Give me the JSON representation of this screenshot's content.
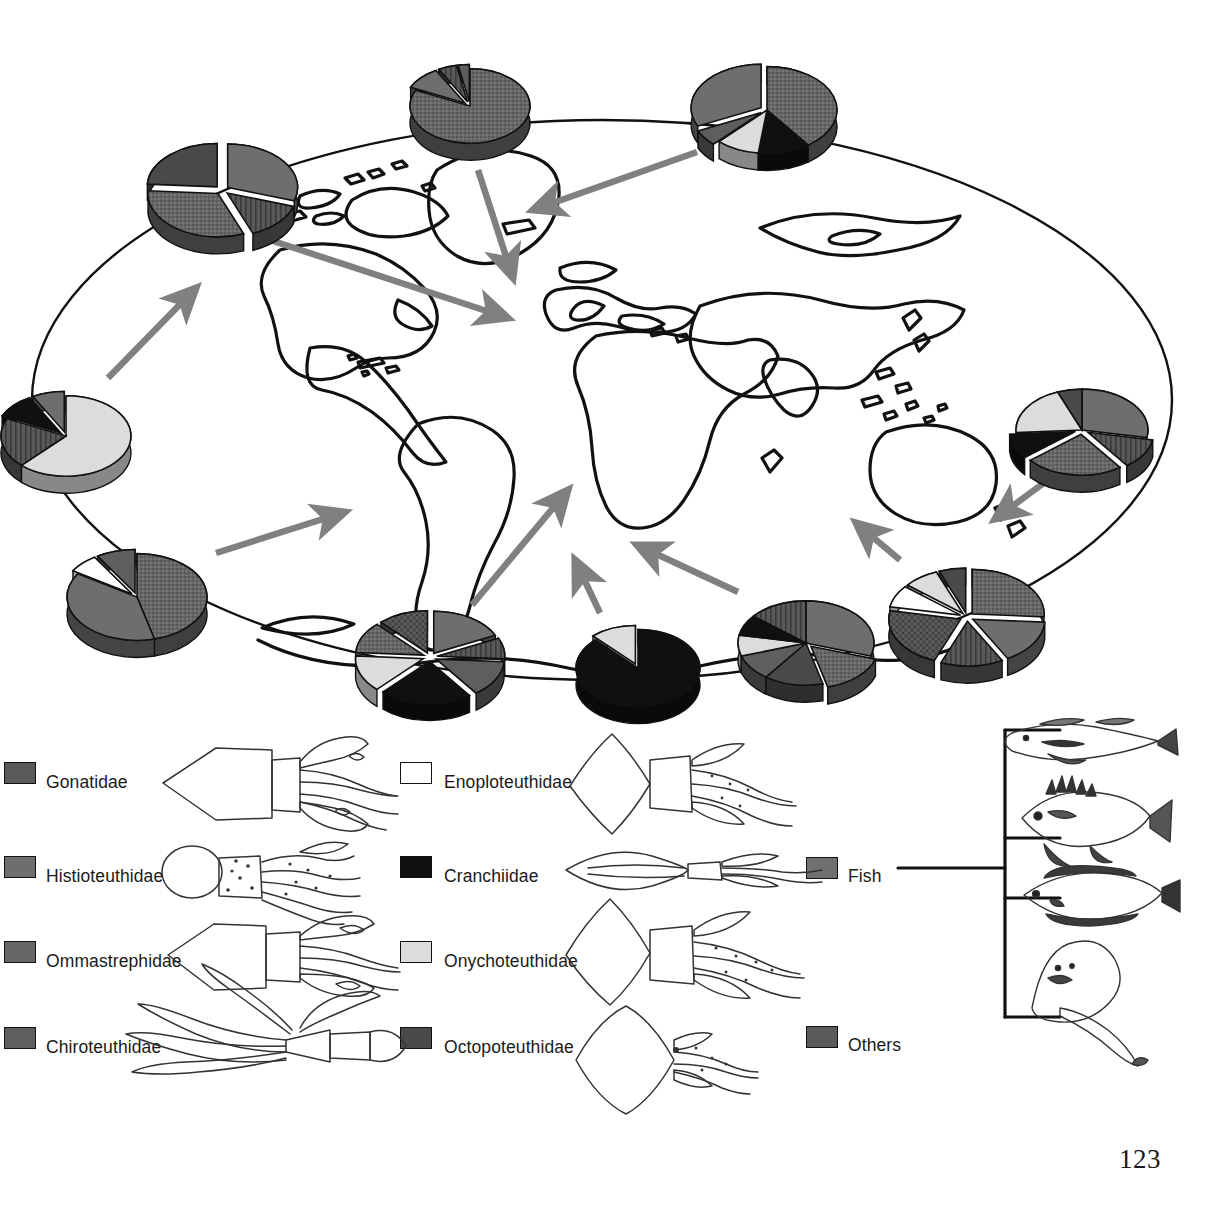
{
  "figure": {
    "page_number": "123",
    "map": {
      "shape": "ellipse",
      "projection_outline_color": "#000000",
      "arrow_color": "#808080"
    }
  },
  "palette": {
    "gonatidae": "#595959",
    "histioteuthidae": "#6e6e6e",
    "ommastrephidae": "#666666",
    "chiroteuthidae": "#5e5e5e",
    "enoploteuthidae": "#ffffff",
    "cranchiidae": "#101010",
    "onychoteuthidae": "#dcdcdc",
    "octopoteuthidae": "#4a4a4a",
    "fish": "#707070",
    "others": "#5a5a5a",
    "outline": "#111111",
    "arrow": "#808080"
  },
  "legend": {
    "columns": [
      {
        "name": "squid-column-1",
        "items": [
          {
            "label": "Gonatidae",
            "color_key": "gonatidae",
            "pattern": "vertical-lines",
            "illustration": "gonatid-squid-drawing"
          },
          {
            "label": "Histioteuthidae",
            "color_key": "histioteuthidae",
            "pattern": "solid",
            "illustration": "histioteuthid-squid-drawing"
          },
          {
            "label": "Ommastrephidae",
            "color_key": "ommastrephidae",
            "pattern": "speckle",
            "illustration": "ommastrephid-squid-drawing"
          },
          {
            "label": "Chiroteuthidae",
            "color_key": "chiroteuthidae",
            "pattern": "solid",
            "illustration": "chiroteuthid-squid-drawing"
          }
        ]
      },
      {
        "name": "squid-column-2",
        "items": [
          {
            "label": "Enoploteuthidae",
            "color_key": "enoploteuthidae",
            "pattern": "solid",
            "illustration": "enoploteuthid-squid-drawing"
          },
          {
            "label": "Cranchiidae",
            "color_key": "cranchiidae",
            "pattern": "solid",
            "illustration": "cranchiid-squid-drawing"
          },
          {
            "label": "Onychoteuthidae",
            "color_key": "onychoteuthidae",
            "pattern": "solid",
            "illustration": "onychoteuthid-squid-drawing"
          },
          {
            "label": "Octopoteuthidae",
            "color_key": "octopoteuthidae",
            "pattern": "solid",
            "illustration": "octopoteuthid-squid-drawing"
          }
        ]
      },
      {
        "name": "prey-column-3",
        "items": [
          {
            "label": "Fish",
            "color_key": "fish",
            "pattern": "solid",
            "illustration": "fish-bracket-drawings"
          },
          {
            "label": "Others",
            "color_key": "others",
            "pattern": "cross-hatch",
            "illustration": "none"
          }
        ]
      }
    ],
    "fish_bracket": {
      "name": "fish-bracket",
      "illustrations": [
        "hake-fish-drawing",
        "redfish-drawing",
        "flatfish-drawing",
        "ray-drawing"
      ]
    }
  },
  "chart_data": {
    "type": "pie",
    "title": "",
    "subtitle": "",
    "categories": [
      "Gonatidae",
      "Histioteuthidae",
      "Ommastrephidae",
      "Chiroteuthidae",
      "Enoploteuthidae",
      "Cranchiidae",
      "Onychoteuthidae",
      "Octopoteuthidae",
      "Fish",
      "Others"
    ],
    "legend_position": "bottom",
    "grid": false,
    "charts": [
      {
        "id": "pie-north-pacific-west",
        "label": "",
        "cx": 222,
        "cy": 190,
        "r": 70,
        "slices": [
          {
            "category": "Histioteuthidae",
            "value": 30,
            "exploded": true
          },
          {
            "category": "Gonatidae",
            "value": 14,
            "exploded": true
          },
          {
            "category": "Ommastrephidae",
            "value": 32,
            "exploded": true
          },
          {
            "category": "Octopoteuthidae",
            "value": 24,
            "exploded": true
          }
        ]
      },
      {
        "id": "pie-arctic-north",
        "label": "",
        "cx": 470,
        "cy": 106,
        "r": 60,
        "slices": [
          {
            "category": "Ommastrephidae",
            "value": 82,
            "exploded": false
          },
          {
            "category": "Histioteuthidae",
            "value": 10,
            "exploded": true
          },
          {
            "category": "Gonatidae",
            "value": 5,
            "exploded": true
          },
          {
            "category": "Chiroteuthidae",
            "value": 3,
            "exploded": true
          }
        ]
      },
      {
        "id": "pie-north-atlantic-east",
        "label": "",
        "cx": 767,
        "cy": 110,
        "r": 70,
        "slices": [
          {
            "category": "Ommastrephidae",
            "value": 40,
            "exploded": false
          },
          {
            "category": "Cranchiidae",
            "value": 12,
            "exploded": false
          },
          {
            "category": "Onychoteuthidae",
            "value": 10,
            "exploded": false
          },
          {
            "category": "Chiroteuthidae",
            "value": 6,
            "exploded": true
          },
          {
            "category": "Histioteuthidae",
            "value": 32,
            "exploded": true
          }
        ]
      },
      {
        "id": "pie-west-atlantic",
        "label": "",
        "cx": 66,
        "cy": 436,
        "r": 65,
        "slices": [
          {
            "category": "Onychoteuthidae",
            "value": 62,
            "exploded": false
          },
          {
            "category": "Gonatidae",
            "value": 20,
            "exploded": false
          },
          {
            "category": "Cranchiidae",
            "value": 10,
            "exploded": true
          },
          {
            "category": "Histioteuthidae",
            "value": 8,
            "exploded": true
          }
        ]
      },
      {
        "id": "pie-south-west-atlantic",
        "label": "",
        "cx": 137,
        "cy": 597,
        "r": 70,
        "slices": [
          {
            "category": "Ommastrephidae",
            "value": 46,
            "exploded": false
          },
          {
            "category": "Histioteuthidae",
            "value": 38,
            "exploded": false
          },
          {
            "category": "Enoploteuthidae",
            "value": 7,
            "exploded": true
          },
          {
            "category": "Chiroteuthidae",
            "value": 9,
            "exploded": true
          }
        ]
      },
      {
        "id": "pie-southern-ocean-atlantic",
        "label": "",
        "cx": 430,
        "cy": 657,
        "r": 68,
        "slices": [
          {
            "category": "Histioteuthidae",
            "value": 18,
            "exploded": true
          },
          {
            "category": "Gonatidae",
            "value": 8,
            "exploded": true
          },
          {
            "category": "Chiroteuthidae",
            "value": 14,
            "exploded": true
          },
          {
            "category": "Cranchiidae",
            "value": 22,
            "exploded": true
          },
          {
            "category": "Onychoteuthidae",
            "value": 14,
            "exploded": true
          },
          {
            "category": "Ommastrephidae",
            "value": 12,
            "exploded": true
          },
          {
            "category": "Others",
            "value": 12,
            "exploded": true
          }
        ]
      },
      {
        "id": "pie-southern-ocean-central",
        "label": "",
        "cx": 638,
        "cy": 668,
        "r": 62,
        "slices": [
          {
            "category": "Cranchiidae",
            "value": 88,
            "exploded": false
          },
          {
            "category": "Onychoteuthidae",
            "value": 12,
            "exploded": true
          }
        ]
      },
      {
        "id": "pie-southern-ocean-indian",
        "label": "",
        "cx": 806,
        "cy": 643,
        "r": 68,
        "slices": [
          {
            "category": "Histioteuthidae",
            "value": 30,
            "exploded": false
          },
          {
            "category": "Ommastrephidae",
            "value": 16,
            "exploded": true
          },
          {
            "category": "Octopoteuthidae",
            "value": 14,
            "exploded": false
          },
          {
            "category": "Chiroteuthidae",
            "value": 10,
            "exploded": false
          },
          {
            "category": "Onychoteuthidae",
            "value": 8,
            "exploded": false
          },
          {
            "category": "Cranchiidae",
            "value": 8,
            "exploded": false
          },
          {
            "category": "Gonatidae",
            "value": 14,
            "exploded": false
          }
        ]
      },
      {
        "id": "pie-southern-ocean-pacific",
        "label": "",
        "cx": 967,
        "cy": 617,
        "r": 72,
        "slices": [
          {
            "category": "Ommastrephidae",
            "value": 26,
            "exploded": true
          },
          {
            "category": "Histioteuthidae",
            "value": 16,
            "exploded": true
          },
          {
            "category": "Gonatidae",
            "value": 14,
            "exploded": true
          },
          {
            "category": "Others",
            "value": 22,
            "exploded": true
          },
          {
            "category": "Enoploteuthidae",
            "value": 8,
            "exploded": true
          },
          {
            "category": "Onychoteuthidae",
            "value": 8,
            "exploded": true
          },
          {
            "category": "Octopoteuthidae",
            "value": 6,
            "exploded": true
          }
        ]
      },
      {
        "id": "pie-south-pacific-east",
        "label": "",
        "cx": 1082,
        "cy": 430,
        "r": 66,
        "slices": [
          {
            "category": "Histioteuthidae",
            "value": 28,
            "exploded": false
          },
          {
            "category": "Gonatidae",
            "value": 12,
            "exploded": true
          },
          {
            "category": "Ommastrephidae",
            "value": 24,
            "exploded": true
          },
          {
            "category": "Cranchiidae",
            "value": 10,
            "exploded": true
          },
          {
            "category": "Onychoteuthidae",
            "value": 20,
            "exploded": false
          },
          {
            "category": "Octopoteuthidae",
            "value": 6,
            "exploded": false
          }
        ]
      }
    ],
    "arrows": [
      {
        "id": "arrow-to-northwest",
        "from": [
          108,
          378
        ],
        "to": [
          196,
          288
        ]
      },
      {
        "id": "arrow-to-northeast",
        "from": [
          270,
          240
        ],
        "to": [
          508,
          318
        ]
      },
      {
        "id": "arrow-south-from-arctic",
        "from": [
          478,
          170
        ],
        "to": [
          513,
          278
        ]
      },
      {
        "id": "arrow-west-from-ne",
        "from": [
          697,
          152
        ],
        "to": [
          533,
          210
        ]
      },
      {
        "id": "arrow-north-from-sw",
        "from": [
          216,
          553
        ],
        "to": [
          345,
          512
        ]
      },
      {
        "id": "arrow-north-center",
        "from": [
          472,
          605
        ],
        "to": [
          568,
          490
        ]
      },
      {
        "id": "arrow-north-from-black",
        "from": [
          600,
          613
        ],
        "to": [
          575,
          560
        ]
      },
      {
        "id": "arrow-west-to-center",
        "from": [
          738,
          592
        ],
        "to": [
          637,
          545
        ]
      },
      {
        "id": "arrow-west-indian",
        "from": [
          900,
          560
        ],
        "to": [
          856,
          523
        ]
      },
      {
        "id": "arrow-down-right",
        "from": [
          1052,
          477
        ],
        "to": [
          995,
          519
        ]
      }
    ]
  }
}
